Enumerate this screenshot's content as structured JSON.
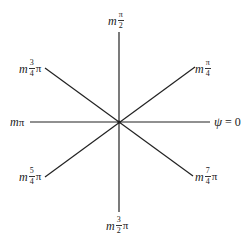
{
  "diagram": {
    "type": "radial-phase-diagram",
    "center": {
      "x": 119,
      "y": 122
    },
    "line_color": "#222222",
    "rays": [
      {
        "angle": "0",
        "label": {
          "prefix": "ψ",
          "frac_num": "",
          "frac_den": "",
          "suffix": "= 0"
        }
      },
      {
        "angle": "π/4",
        "label": {
          "prefix": "m",
          "frac_num": "π",
          "frac_den": "4",
          "suffix": ""
        }
      },
      {
        "angle": "π/2",
        "label": {
          "prefix": "m",
          "frac_num": "π",
          "frac_den": "2",
          "suffix": ""
        }
      },
      {
        "angle": "3π/4",
        "label": {
          "prefix": "m",
          "frac_num": "3",
          "frac_den": "4",
          "suffix": "π"
        }
      },
      {
        "angle": "π",
        "label": {
          "prefix": "m",
          "frac_num": "",
          "frac_den": "",
          "suffix": "π"
        }
      },
      {
        "angle": "5π/4",
        "label": {
          "prefix": "m",
          "frac_num": "5",
          "frac_den": "4",
          "suffix": "π"
        }
      },
      {
        "angle": "3π/2",
        "label": {
          "prefix": "m",
          "frac_num": "3",
          "frac_den": "2",
          "suffix": "π"
        }
      },
      {
        "angle": "7π/4",
        "label": {
          "prefix": "m",
          "frac_num": "7",
          "frac_den": "4",
          "suffix": "π"
        }
      }
    ]
  }
}
